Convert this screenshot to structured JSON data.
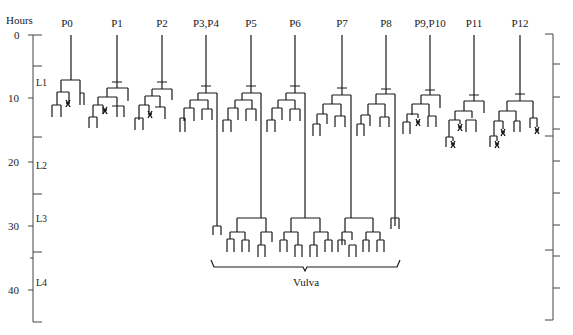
{
  "axis": {
    "title": "Hours",
    "ticks": [
      {
        "label": "0",
        "hour": 0
      },
      {
        "label": "10",
        "hour": 10
      },
      {
        "label": "20",
        "hour": 20
      },
      {
        "label": "30",
        "hour": 30
      },
      {
        "label": "40",
        "hour": 40
      }
    ],
    "stages": [
      {
        "label": "L1",
        "hour": 6.5
      },
      {
        "label": "L2",
        "hour": 20.2
      },
      {
        "label": "L3",
        "hour": 29
      },
      {
        "label": "L4",
        "hour": 39
      }
    ],
    "left_minor_ticks_hours": [
      5,
      16,
      25,
      34,
      45
    ],
    "right_ticks_hours": [
      0,
      4.5,
      9.5,
      14.5,
      15.5,
      19.5,
      24.5,
      29.5,
      33.5,
      34.5,
      39.5,
      45
    ]
  },
  "lineages": [
    {
      "label": "P0",
      "x": 67
    },
    {
      "label": "P1",
      "x": 117
    },
    {
      "label": "P2",
      "x": 162
    },
    {
      "label": "P3,P4",
      "x": 206
    },
    {
      "label": "P5",
      "x": 251
    },
    {
      "label": "P6",
      "x": 295
    },
    {
      "label": "P7",
      "x": 342
    },
    {
      "label": "P8",
      "x": 386
    },
    {
      "label": "P9,P10",
      "x": 430
    },
    {
      "label": "P11",
      "x": 474
    },
    {
      "label": "P12",
      "x": 520
    }
  ],
  "bracket": {
    "label": "Vulva"
  }
}
